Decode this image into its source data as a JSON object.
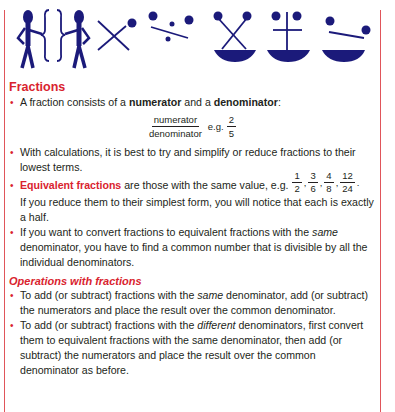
{
  "colors": {
    "accent": "#d9232e",
    "icon": "#1b1a7a",
    "body_text": "#231f20",
    "border": "#e0555a"
  },
  "icons": [
    {
      "name": "equivalent-figures-icon",
      "meaning": "two stick figures with braces"
    },
    {
      "name": "multiply-icon",
      "meaning": "times sign with ball"
    },
    {
      "name": "divide-icon",
      "meaning": "division sign with balls"
    },
    {
      "name": "multiply-balance-icon",
      "meaning": "cross over scale"
    },
    {
      "name": "add-balance-icon",
      "meaning": "plus over scale"
    },
    {
      "name": "subtract-balance-icon",
      "meaning": "minus over scale"
    }
  ],
  "section": {
    "title": "Fractions",
    "bullets": {
      "b1": {
        "pre": "A fraction consists of a ",
        "bold1": "numerator",
        "mid": " and a ",
        "bold2": "denominator",
        "post": ":"
      },
      "frac_example": {
        "numerator": "numerator",
        "denominator": "denominator",
        "eg": "e.g.",
        "ex_num": "2",
        "ex_den": "5"
      },
      "b2": "With calculations, it is best to try and simplify or reduce fractions to their lowest terms.",
      "b3": {
        "bold": "Equivalent fractions",
        "text": " are those with the same value, e.g. ",
        "fractions": [
          {
            "num": "1",
            "den": "2"
          },
          {
            "num": "3",
            "den": "6"
          },
          {
            "num": "4",
            "den": "8"
          },
          {
            "num": "12",
            "den": "24"
          }
        ],
        "sep": ",",
        "end": ".",
        "para": "If you reduce them to their simplest form, you will notice that each is exactly a half."
      },
      "b4": {
        "pre": "If you want to convert fractions to equivalent fractions with the ",
        "italic": "same",
        "post": " denominator, you have to find a common number that is divisible by all the individual denominators."
      }
    },
    "subheading": "Operations with fractions",
    "ops": {
      "o1": {
        "pre": "To add (or subtract) fractions with the ",
        "italic": "same",
        "post": " denominator, add (or subtract) the numerators and place the result over the common denominator."
      },
      "o2": {
        "pre": "To add (or subtract) fractions with the ",
        "italic": "different",
        "post": " denominators, first convert them to equivalent fractions with the same denominator, then add (or subtract) the numerators and place the result over the common denominator as before."
      }
    }
  }
}
